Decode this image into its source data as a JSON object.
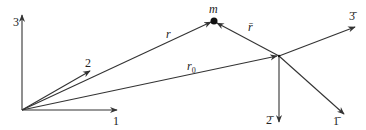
{
  "diagram": {
    "stroke_color": "#333333",
    "inertial_frame": {
      "origin": [
        22,
        110
      ],
      "axes": [
        {
          "id": "axis-1",
          "label": "1",
          "tip": [
            117,
            110
          ],
          "label_pos": [
            113,
            125
          ]
        },
        {
          "id": "axis-2",
          "label": "2",
          "tip": [
            90,
            71
          ],
          "label_pos": [
            85,
            67
          ]
        },
        {
          "id": "axis-3",
          "label": "3",
          "tip": [
            22,
            15
          ],
          "label_pos": [
            13,
            26
          ]
        }
      ]
    },
    "body_frame": {
      "origin": [
        279,
        56
      ],
      "axes": [
        {
          "id": "axis-1-bar",
          "label": "1̄",
          "tip": [
            344,
            114
          ],
          "label_pos": [
            333,
            125
          ]
        },
        {
          "id": "axis-2-bar",
          "label": "2̄",
          "tip": [
            279,
            122
          ],
          "label_pos": [
            266,
            124
          ]
        },
        {
          "id": "axis-3-bar",
          "label": "3̄",
          "tip": [
            355,
            27
          ],
          "label_pos": [
            349,
            20
          ]
        }
      ]
    },
    "vectors": [
      {
        "id": "vector-r",
        "label": "r",
        "from": [
          22,
          110
        ],
        "to": [
          211,
          22
        ],
        "label_pos": [
          166,
          38
        ]
      },
      {
        "id": "vector-r0",
        "label": "r",
        "subscript": "0",
        "from": [
          22,
          110
        ],
        "to": [
          277,
          56
        ],
        "label_pos": [
          187,
          70
        ]
      },
      {
        "id": "vector-r-bar",
        "label": "r̄",
        "from": [
          279,
          56
        ],
        "to": [
          217,
          23
        ],
        "label_pos": [
          248,
          31
        ]
      }
    ],
    "mass_point": {
      "label": "m",
      "pos": [
        214,
        21
      ],
      "label_pos": [
        209,
        13
      ]
    }
  }
}
